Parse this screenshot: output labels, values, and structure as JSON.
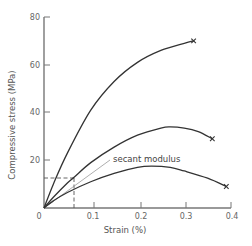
{
  "chart_data": {
    "type": "line",
    "title": "",
    "xlabel": "Strain (%)",
    "ylabel": "Compressive stress (MPa)",
    "xlim": [
      0,
      0.4
    ],
    "ylim": [
      0,
      80
    ],
    "x_ticks": [
      0,
      0.1,
      0.2,
      0.3,
      0.4
    ],
    "x_tick_labels": [
      "0",
      "0.1",
      "0.2",
      "0.3",
      "0.4"
    ],
    "y_ticks": [
      20,
      40,
      60,
      80
    ],
    "y_tick_labels": [
      "20",
      "40",
      "60",
      "80"
    ],
    "grid": false,
    "legend": null,
    "series": [
      {
        "name": "high-strength",
        "end_marker": "x",
        "x": [
          0,
          0.02,
          0.05,
          0.1,
          0.15,
          0.2,
          0.25,
          0.3,
          0.32
        ],
        "y": [
          0,
          10,
          23,
          41,
          53,
          61,
          66,
          69,
          70
        ]
      },
      {
        "name": "medium-strength",
        "end_marker": "x",
        "x": [
          0,
          0.02,
          0.05,
          0.065,
          0.1,
          0.15,
          0.2,
          0.25,
          0.27,
          0.3,
          0.33,
          0.36
        ],
        "y": [
          0,
          4.5,
          10.5,
          13,
          19,
          25.5,
          30.5,
          33.5,
          34,
          33.5,
          32,
          29
        ]
      },
      {
        "name": "low-strength",
        "end_marker": "x",
        "x": [
          0,
          0.02,
          0.05,
          0.1,
          0.15,
          0.2,
          0.23,
          0.27,
          0.3,
          0.35,
          0.39
        ],
        "y": [
          0,
          3,
          6.5,
          11,
          14.5,
          17,
          17.5,
          17,
          15.5,
          12.5,
          9
        ]
      }
    ],
    "annotations": [
      {
        "text": "secant modulus",
        "type": "secant-line",
        "from": [
          0,
          0
        ],
        "through": [
          0.065,
          12.5
        ],
        "to": [
          0.142,
          20.5
        ]
      },
      {
        "type": "dashed-reference",
        "point": [
          0.065,
          12.5
        ],
        "description": "dashed lines from axes to point on medium curve"
      }
    ]
  },
  "labels": {
    "xlabel": "Strain (%)",
    "ylabel": "Compressive stress (MPa)",
    "secant": "secant modulus",
    "origin": "0",
    "x_ticks": [
      "0.1",
      "0.2",
      "0.3",
      "0.4"
    ],
    "y_ticks": [
      "20",
      "40",
      "60",
      "80"
    ]
  },
  "colors": {
    "axis": "#777777",
    "curve": "#333333",
    "secant": "#999999",
    "text": "#555555"
  }
}
